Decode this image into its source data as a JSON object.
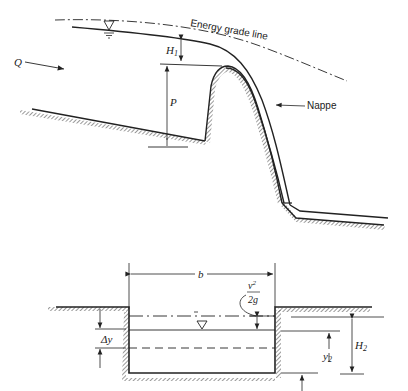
{
  "figure_top": {
    "title": "Sharp-crested / ogee weir profile",
    "labels": {
      "energy_grade_line": "Energy grade line",
      "flow": "Q",
      "head": "H",
      "head_sub": "1",
      "weir_height": "P",
      "nappe": "Nappe"
    },
    "symbols": [
      "water-surface-triangle"
    ]
  },
  "figure_bottom": {
    "title": "Channel cross-section",
    "labels": {
      "width": "b",
      "velocity_head_num": "v",
      "velocity_head_exp": "2",
      "velocity_head_den": "2g",
      "delta_y": "Δy",
      "depth": "y",
      "depth_sub": "2",
      "head2": "H",
      "head2_sub": "2"
    },
    "symbols": [
      "water-surface-triangle"
    ]
  }
}
